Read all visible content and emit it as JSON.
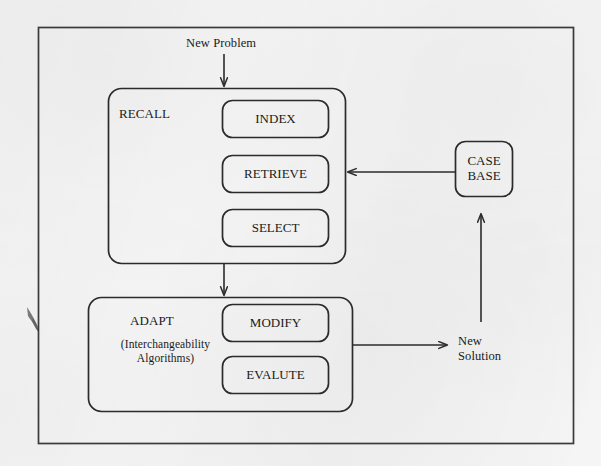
{
  "diagram": {
    "type": "flowchart",
    "title_visible": false,
    "background_color": "#f5f5f5",
    "line_color": "#2b2b2b",
    "text_color": "#1a1a1a",
    "outer_frame": {
      "name": "outer-frame"
    },
    "groups": [
      {
        "id": "recall",
        "label": "RECALL",
        "sublabel": "",
        "nodes": [
          {
            "id": "index",
            "label": "INDEX"
          },
          {
            "id": "retrieve",
            "label": "RETRIEVE"
          },
          {
            "id": "select",
            "label": "SELECT"
          }
        ]
      },
      {
        "id": "adapt",
        "label": "ADAPT",
        "sublabel": "(Interchangeability\nAlgorithms)",
        "nodes": [
          {
            "id": "modify",
            "label": "MODIFY"
          },
          {
            "id": "evalute",
            "label": "EVALUTE"
          }
        ]
      }
    ],
    "standalone_nodes": [
      {
        "id": "case-base",
        "label": "CASE\nBASE"
      }
    ],
    "edge_labels": [
      {
        "id": "new-problem",
        "label": "New Problem",
        "direction": "down"
      },
      {
        "id": "new-solution",
        "label": "New\nSolution",
        "direction": "right"
      }
    ],
    "arrows": [
      {
        "id": "new-problem-to-recall",
        "from": "new-problem",
        "to": "recall",
        "direction": "down"
      },
      {
        "id": "case-base-to-recall",
        "from": "case-base",
        "to": "recall",
        "direction": "left"
      },
      {
        "id": "recall-to-adapt",
        "from": "recall",
        "to": "adapt",
        "direction": "down"
      },
      {
        "id": "adapt-to-new-solution",
        "from": "adapt",
        "to": "new-solution",
        "direction": "right"
      },
      {
        "id": "solution-to-case-base",
        "from": "new-solution",
        "to": "case-base",
        "direction": "up"
      }
    ]
  }
}
